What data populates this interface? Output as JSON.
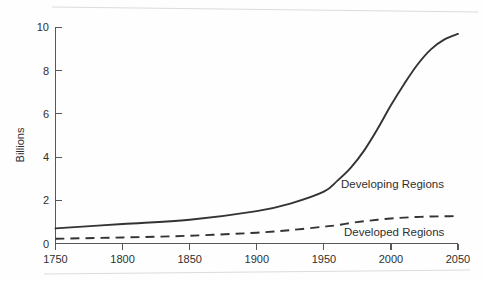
{
  "chart_data": {
    "type": "line",
    "title": "",
    "xlabel": "",
    "ylabel": "Billions",
    "xlim": [
      1750,
      2050
    ],
    "ylim": [
      0,
      10
    ],
    "xticks": [
      1750,
      1800,
      1850,
      1900,
      1950,
      2000,
      2050
    ],
    "yticks": [
      0,
      2,
      4,
      6,
      8,
      10
    ],
    "grid": false,
    "legend": "inline-annotations",
    "x": [
      1750,
      1800,
      1850,
      1900,
      1925,
      1950,
      1960,
      1970,
      1980,
      1990,
      2000,
      2010,
      2020,
      2030,
      2040,
      2050
    ],
    "series": [
      {
        "name": "Developing Regions",
        "style": "solid",
        "values": [
          0.7,
          0.9,
          1.1,
          1.5,
          1.85,
          2.4,
          2.9,
          3.5,
          4.3,
          5.3,
          6.4,
          7.4,
          8.3,
          9.0,
          9.45,
          9.7
        ]
      },
      {
        "name": "Developed Regions",
        "style": "dashed",
        "values": [
          0.22,
          0.28,
          0.36,
          0.5,
          0.62,
          0.78,
          0.85,
          0.95,
          1.03,
          1.1,
          1.16,
          1.2,
          1.23,
          1.25,
          1.26,
          1.27
        ]
      }
    ],
    "annotations": [
      {
        "text": "Developing Regions",
        "x": 1975,
        "y": 2.2
      },
      {
        "text": "Developed Regions",
        "x": 1977,
        "y": 0.45
      }
    ]
  },
  "axes": {
    "y_title": "Billions",
    "y_tick_labels": [
      "10",
      "8",
      "6",
      "4",
      "2",
      "0"
    ],
    "x_tick_labels": [
      "1750",
      "1800",
      "1850",
      "1900",
      "1950",
      "2000",
      "2050"
    ]
  },
  "labels": {
    "developing": "Developing Regions",
    "developed": "Developed Regions"
  },
  "colors": {
    "line": "#333335",
    "axis": "#58585a",
    "background": "#fefefe",
    "text": "#2f2f31"
  }
}
